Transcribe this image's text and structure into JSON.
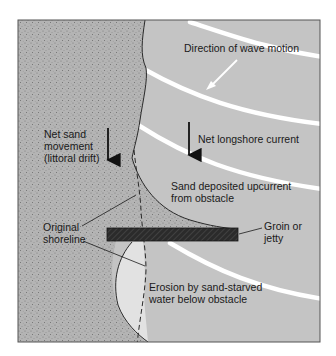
{
  "figure": {
    "colors": {
      "sand": "#b4b4b4",
      "sand_speckle": "#6e6e6e",
      "water": "#c4c4c4",
      "wave_crest": "#ffffff",
      "eroded_area": "#e2e2e2",
      "groin": "#2b2b2b",
      "outline": "#2a2a2a",
      "frame": "#555555"
    }
  },
  "labels": {
    "wave_direction": "Direction of wave motion",
    "longshore_current": "Net longshore current",
    "sand_movement": [
      "Net sand",
      "movement",
      "(littoral drift)"
    ],
    "sand_deposited": [
      "Sand deposited upcurrent",
      "from obstacle"
    ],
    "groin": [
      "Groin or",
      "jetty"
    ],
    "original_shoreline": [
      "Original",
      "shoreline"
    ],
    "erosion": [
      "Erosion by sand-starved",
      "water below obstacle"
    ]
  },
  "icons": {
    "wave_arrow": "arrow-down-left-icon",
    "current_arrow": "arrow-down-icon",
    "drift_arrow": "arrow-down-icon"
  }
}
